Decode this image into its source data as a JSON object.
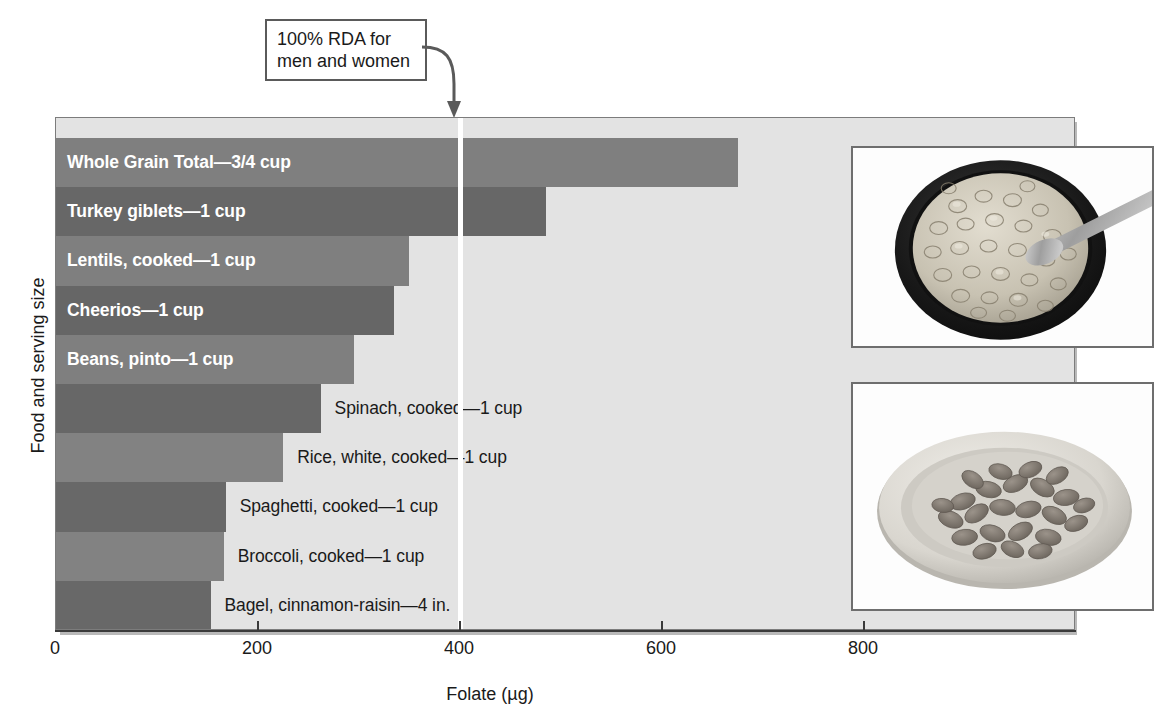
{
  "chart_data": {
    "type": "bar",
    "orientation": "horizontal",
    "title": "",
    "xlabel": "Folate (µg)",
    "ylabel": "Food and serving size",
    "xlim": [
      0,
      1010
    ],
    "xticks": [
      0,
      200,
      400,
      600,
      800
    ],
    "xticklabels": [
      "0",
      "200",
      "400",
      "600",
      "800"
    ],
    "grid": false,
    "legend": null,
    "categories": [
      "Whole Grain Total—3/4 cup",
      "Turkey giblets—1 cup",
      "Lentils, cooked—1 cup",
      "Cheerios—1 cup",
      "Beans, pinto—1 cup",
      "Spinach, cooked—1 cup",
      "Rice, white, cooked—1 cup",
      "Spaghetti, cooked—1 cup",
      "Broccoli, cooked—1 cup",
      "Bagel, cinnamon-raisin—4 in."
    ],
    "values": [
      675,
      485,
      350,
      335,
      295,
      262,
      225,
      168,
      166,
      153
    ],
    "bar_colors": [
      "#7f7f7f",
      "#676767",
      "#7f7f7f",
      "#666666",
      "#7f7f7f",
      "#676767",
      "#828282",
      "#686868",
      "#828282",
      "#686868"
    ],
    "label_inside": [
      true,
      true,
      true,
      true,
      true,
      false,
      false,
      false,
      false,
      false
    ],
    "annotations": [
      {
        "name": "rda-callout",
        "text": "100% RDA for\nmen and women",
        "value": 400,
        "marker": "white vertical reference line with arrow"
      }
    ]
  },
  "plot": {
    "background": "#e3e3e3",
    "border_color": "#7c7c7c",
    "shadow_color": "#b9b9b9",
    "rda_line_color": "#ffffff"
  },
  "insets": [
    {
      "name": "cereal-bowl-photo",
      "alt": "Dark bowl filled with ring-shaped oat cereal and a metal spoon",
      "bowl_color": "#1d1d1d",
      "cereal_color": "#cfcabc",
      "spoon_color": "#b4b4b4"
    },
    {
      "name": "pinto-beans-photo",
      "alt": "White plate heaped with cooked pinto beans",
      "plate_color": "#d8d6d0",
      "beans_color": "#8a837c"
    }
  ],
  "caption": {
    "text": ""
  }
}
